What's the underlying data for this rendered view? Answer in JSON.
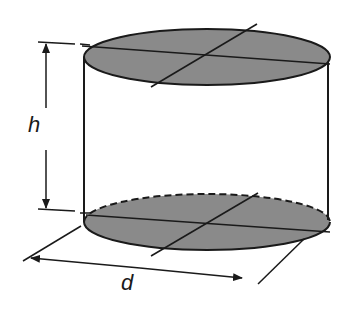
{
  "diagram": {
    "labels": {
      "height": "h",
      "diameter": "d"
    },
    "colors": {
      "fill": "#8a8a8a",
      "stroke": "#1a1a1a",
      "background": "#ffffff"
    },
    "shapes": {
      "top_ellipse": {
        "cx": 207,
        "cy": 57,
        "rx": 123,
        "ry": 28
      },
      "bottom_ellipse": {
        "cx": 207,
        "cy": 222,
        "rx": 123,
        "ry": 28,
        "back_edge": "dashed"
      },
      "left_side_x": 84,
      "right_side_x": 330
    }
  }
}
